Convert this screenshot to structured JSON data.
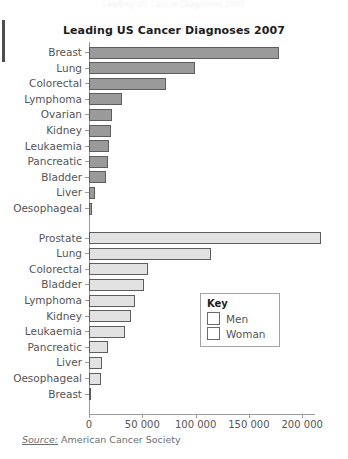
{
  "page": {
    "ghost_top_text": "Leading US Cancer Diagnoses 2007",
    "background": "#ffffff"
  },
  "source": {
    "label": "Source:",
    "text": " American Cancer Society"
  },
  "legend": {
    "title": "Key",
    "items": [
      {
        "label": "Men",
        "color": "#e2e2e2"
      },
      {
        "label": "Woman",
        "color": "#9a9a9a"
      }
    ]
  },
  "chart_data": {
    "type": "bar",
    "orientation": "horizontal",
    "title": "Leading US Cancer Diagnoses 2007",
    "xlabel": "",
    "ylabel": "",
    "xlim": [
      0,
      230000
    ],
    "xticks": [
      0,
      50000,
      100000,
      150000,
      200000
    ],
    "xtick_labels": [
      "0",
      "50 000",
      "100 000",
      "150 000",
      "200 000"
    ],
    "grid": false,
    "legend_position": "center-right",
    "groups": [
      {
        "name": "Woman",
        "color": "#9a9a9a",
        "categories": [
          "Breast",
          "Lung",
          "Colorectal",
          "Lymphoma",
          "Ovarian",
          "Kidney",
          "Leukaemia",
          "Pancreatic",
          "Bladder",
          "Liver",
          "Oesophageal"
        ],
        "values": [
          178000,
          99000,
          72000,
          31000,
          22000,
          21000,
          19000,
          18000,
          16000,
          6000,
          3000
        ]
      },
      {
        "name": "Men",
        "color": "#e2e2e2",
        "categories": [
          "Prostate",
          "Lung",
          "Colorectal",
          "Bladder",
          "Lymphoma",
          "Kidney",
          "Leukaemia",
          "Pancreatic",
          "Liver",
          "Oesophageal",
          "Breast"
        ],
        "values": [
          218000,
          114000,
          55000,
          52000,
          43000,
          39000,
          34000,
          18000,
          12000,
          11000,
          2000
        ]
      }
    ]
  }
}
